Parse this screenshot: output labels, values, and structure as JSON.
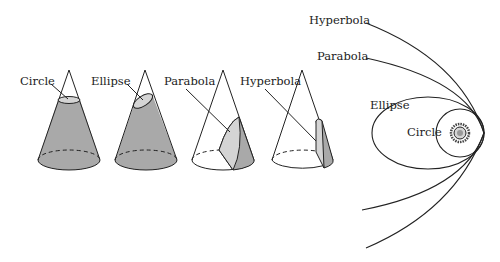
{
  "colors": {
    "ink": "#222222",
    "shade_dark": "#a9a9a9",
    "shade_light": "#d4d4d4",
    "background": "#ffffff"
  },
  "cones": {
    "circle_label": "Circle",
    "ellipse_label": "Ellipse",
    "parabola_label": "Parabola",
    "hyperbola_label": "Hyperbola"
  },
  "orbits": {
    "hyperbola_label": "Hyperbola",
    "parabola_label": "Parabola",
    "ellipse_label": "Ellipse",
    "circle_label": "Circle",
    "center_icon": "sun-icon"
  }
}
